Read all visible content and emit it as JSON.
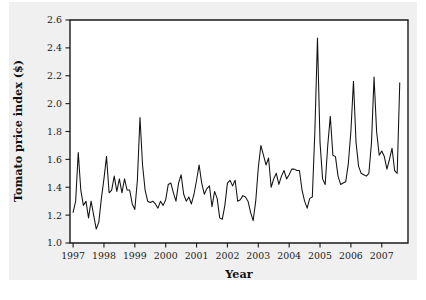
{
  "figure": {
    "background_color": "#f0f0f0",
    "plot_background_color": "#ffffff",
    "axis_color": "#1a1a1a",
    "line_color": "#111111"
  },
  "chart_data": {
    "type": "line",
    "title": "",
    "subtitle": "",
    "xlabel": "Year",
    "ylabel": "Tomato price index ($)",
    "xlim": [
      1996.9,
      2007.85
    ],
    "ylim": [
      1.0,
      2.6
    ],
    "grid": false,
    "legend": null,
    "xticks": [
      1997,
      1998,
      1999,
      2000,
      2001,
      2002,
      2003,
      2004,
      2005,
      2006,
      2007
    ],
    "xticklabels": [
      "1997",
      "1998",
      "1999",
      "2000",
      "2001",
      "2002",
      "2003",
      "2004",
      "2005",
      "2006",
      "2007"
    ],
    "yticks": [
      1.0,
      1.2,
      1.4,
      1.6,
      1.8,
      2.0,
      2.2,
      2.4,
      2.6
    ],
    "yticklabels": [
      "1.0",
      "1.2",
      "1.4",
      "1.6",
      "1.8",
      "2.0",
      "2.2",
      "2.4",
      "2.6"
    ],
    "series": [
      {
        "name": "Tomato price index",
        "x": [
          1997.0,
          1997.083,
          1997.167,
          1997.25,
          1997.333,
          1997.417,
          1997.5,
          1997.583,
          1997.667,
          1997.75,
          1997.833,
          1997.917,
          1998.0,
          1998.083,
          1998.167,
          1998.25,
          1998.333,
          1998.417,
          1998.5,
          1998.583,
          1998.667,
          1998.75,
          1998.833,
          1998.917,
          1999.0,
          1999.083,
          1999.167,
          1999.25,
          1999.333,
          1999.417,
          1999.5,
          1999.583,
          1999.667,
          1999.75,
          1999.833,
          1999.917,
          2000.0,
          2000.083,
          2000.167,
          2000.25,
          2000.333,
          2000.417,
          2000.5,
          2000.583,
          2000.667,
          2000.75,
          2000.833,
          2000.917,
          2001.0,
          2001.083,
          2001.167,
          2001.25,
          2001.333,
          2001.417,
          2001.5,
          2001.583,
          2001.667,
          2001.75,
          2001.833,
          2001.917,
          2002.0,
          2002.083,
          2002.167,
          2002.25,
          2002.333,
          2002.417,
          2002.5,
          2002.583,
          2002.667,
          2002.75,
          2002.833,
          2002.917,
          2003.0,
          2003.083,
          2003.167,
          2003.25,
          2003.333,
          2003.417,
          2003.5,
          2003.583,
          2003.667,
          2003.75,
          2003.833,
          2003.917,
          2004.0,
          2004.083,
          2004.167,
          2004.25,
          2004.333,
          2004.417,
          2004.5,
          2004.583,
          2004.667,
          2004.75,
          2004.833,
          2004.917,
          2005.0,
          2005.083,
          2005.167,
          2005.25,
          2005.333,
          2005.417,
          2005.5,
          2005.583,
          2005.667,
          2005.75,
          2005.833,
          2005.917,
          2006.0,
          2006.083,
          2006.167,
          2006.25,
          2006.333,
          2006.417,
          2006.5,
          2006.583,
          2006.667,
          2006.75,
          2006.833,
          2006.917,
          2007.0,
          2007.083,
          2007.167,
          2007.25,
          2007.333,
          2007.417,
          2007.5,
          2007.583
        ],
        "values": [
          1.22,
          1.3,
          1.65,
          1.38,
          1.27,
          1.3,
          1.18,
          1.3,
          1.2,
          1.1,
          1.15,
          1.32,
          1.46,
          1.62,
          1.36,
          1.38,
          1.48,
          1.37,
          1.46,
          1.36,
          1.46,
          1.38,
          1.38,
          1.28,
          1.24,
          1.45,
          1.9,
          1.56,
          1.38,
          1.3,
          1.29,
          1.3,
          1.28,
          1.25,
          1.3,
          1.27,
          1.31,
          1.42,
          1.43,
          1.36,
          1.3,
          1.43,
          1.49,
          1.35,
          1.3,
          1.33,
          1.28,
          1.35,
          1.45,
          1.56,
          1.43,
          1.35,
          1.39,
          1.41,
          1.26,
          1.37,
          1.32,
          1.18,
          1.17,
          1.27,
          1.43,
          1.45,
          1.41,
          1.45,
          1.3,
          1.31,
          1.34,
          1.33,
          1.3,
          1.22,
          1.16,
          1.3,
          1.54,
          1.7,
          1.63,
          1.56,
          1.61,
          1.4,
          1.46,
          1.5,
          1.42,
          1.48,
          1.52,
          1.46,
          1.49,
          1.53,
          1.53,
          1.52,
          1.52,
          1.38,
          1.3,
          1.25,
          1.32,
          1.33,
          1.8,
          2.47,
          1.72,
          1.46,
          1.42,
          1.7,
          1.91,
          1.63,
          1.62,
          1.48,
          1.42,
          1.43,
          1.44,
          1.57,
          1.8,
          2.16,
          1.72,
          1.55,
          1.5,
          1.49,
          1.48,
          1.5,
          1.72,
          2.19,
          1.8,
          1.63,
          1.66,
          1.62,
          1.53,
          1.6,
          1.68,
          1.52,
          1.5,
          2.15
        ]
      }
    ]
  }
}
